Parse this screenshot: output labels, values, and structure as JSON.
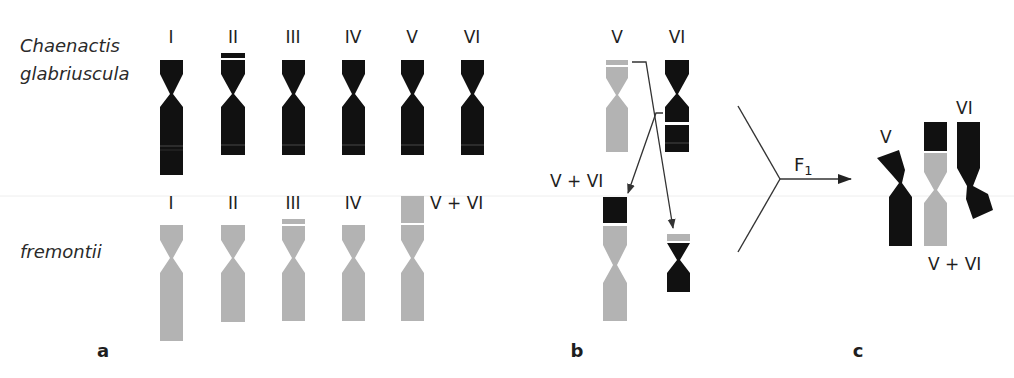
{
  "figure": {
    "species": {
      "top": [
        "Chaenactis",
        "glabriuscula"
      ],
      "bottom": "fremontii"
    },
    "colors": {
      "glabriuscula": "#111111",
      "fremontii": "#b3b3b3",
      "band_gap": "#ffffff",
      "line": "#333333"
    },
    "panel_a": {
      "label": "a",
      "top_row_labels": [
        "I",
        "II",
        "III",
        "IV",
        "V",
        "VI"
      ],
      "bottom_row_labels": [
        "I",
        "II",
        "III",
        "IV",
        "V + VI"
      ]
    },
    "panel_b": {
      "label": "b",
      "top_labels": [
        "V",
        "VI"
      ],
      "translocation_label": "V + VI"
    },
    "panel_c": {
      "label": "c",
      "cross_label": "F",
      "cross_subscript": "1",
      "labels": {
        "v": "V",
        "vi": "VI",
        "vvi": "V + VI"
      }
    }
  }
}
